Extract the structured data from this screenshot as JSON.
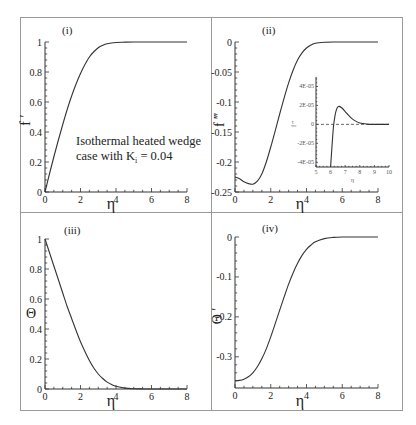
{
  "figure": {
    "annotation": {
      "line1": "Isothermal heated wedge",
      "line2_prefix": "case with K",
      "line2_sub": "i",
      "line2_suffix": " = 0.04"
    }
  },
  "chart_data": [
    {
      "panel": "(i)",
      "type": "line",
      "xlabel": "η",
      "ylabel": "f ′",
      "xlim": [
        0,
        8
      ],
      "ylim": [
        0,
        1
      ],
      "xticks": [
        0,
        2,
        4,
        6,
        8
      ],
      "yticks": [
        0,
        0.2,
        0.4,
        0.6,
        0.8,
        1
      ],
      "ytick_labels": [
        "0",
        "0.2",
        "0.4",
        "0.6",
        "0.8",
        "1"
      ],
      "grid": false,
      "series": [
        {
          "name": "f'",
          "x": [
            0,
            0.25,
            0.5,
            0.75,
            1,
            1.25,
            1.5,
            1.75,
            2,
            2.25,
            2.5,
            2.75,
            3,
            3.25,
            3.5,
            4,
            4.5,
            5,
            6,
            7,
            8
          ],
          "y": [
            0,
            0.12,
            0.235,
            0.345,
            0.45,
            0.55,
            0.64,
            0.72,
            0.79,
            0.85,
            0.9,
            0.935,
            0.962,
            0.978,
            0.988,
            0.997,
            0.999,
            1,
            1,
            1,
            1
          ]
        }
      ]
    },
    {
      "panel": "(ii)",
      "type": "line",
      "xlabel": "η",
      "ylabel": "f ‴",
      "xlim": [
        0,
        8
      ],
      "ylim": [
        -0.25,
        0
      ],
      "xticks": [
        0,
        2,
        4,
        6,
        8
      ],
      "yticks": [
        -0.25,
        -0.2,
        -0.15,
        -0.1,
        -0.05,
        0
      ],
      "ytick_labels": [
        "-0.25",
        "-0.2",
        "-0.15",
        "-0.1",
        "-0.05",
        "0"
      ],
      "grid": false,
      "series": [
        {
          "name": "f'''",
          "x": [
            0,
            0.25,
            0.5,
            0.75,
            1,
            1.25,
            1.5,
            1.75,
            2,
            2.25,
            2.5,
            2.75,
            3,
            3.25,
            3.5,
            3.75,
            4,
            4.25,
            4.5,
            5,
            5.5,
            6,
            7,
            8
          ],
          "y": [
            -0.225,
            -0.228,
            -0.233,
            -0.236,
            -0.237,
            -0.232,
            -0.22,
            -0.2,
            -0.175,
            -0.148,
            -0.12,
            -0.093,
            -0.068,
            -0.047,
            -0.03,
            -0.018,
            -0.01,
            -0.005,
            -0.002,
            -0.0005,
            0,
            0,
            0,
            0
          ]
        }
      ],
      "inset": {
        "type": "line",
        "xlabel": "η",
        "ylabel": "f ‴",
        "xlim": [
          5,
          10
        ],
        "ylim": [
          -4.5e-05,
          5e-05
        ],
        "xticks": [
          5,
          6,
          7,
          8,
          9,
          10
        ],
        "yticks": [
          -4e-05,
          -2e-05,
          0,
          2e-05,
          4e-05
        ],
        "ytick_labels": [
          "-4E-05",
          "-2E-05",
          "0",
          "2E-05",
          "4E-05"
        ],
        "reference_line": {
          "y": 0,
          "style": "dashed"
        },
        "series": [
          {
            "name": "f''' (zoom)",
            "x": [
              6.0,
              6.1,
              6.2,
              6.3,
              6.4,
              6.5,
              6.6,
              6.8,
              7.0,
              7.3,
              7.6,
              8.0,
              8.5,
              9.0,
              9.5,
              10.0
            ],
            "y": [
              -4.5e-05,
              -2.2e-05,
              -2e-06,
              9e-06,
              1.55e-05,
              1.85e-05,
              1.9e-05,
              1.7e-05,
              1.35e-05,
              8.5e-06,
              4.5e-06,
              1.5e-06,
              3e-07,
              0,
              0,
              0
            ]
          }
        ]
      }
    },
    {
      "panel": "(iii)",
      "type": "line",
      "xlabel": "η",
      "ylabel": "Θ",
      "xlim": [
        0,
        8
      ],
      "ylim": [
        0,
        1
      ],
      "xticks": [
        0,
        2,
        4,
        6,
        8
      ],
      "yticks": [
        0,
        0.2,
        0.4,
        0.6,
        0.8,
        1
      ],
      "ytick_labels": [
        "0",
        "0.2",
        "0.4",
        "0.6",
        "0.8",
        "1"
      ],
      "grid": false,
      "series": [
        {
          "name": "Θ",
          "x": [
            0,
            0.25,
            0.5,
            0.75,
            1,
            1.25,
            1.5,
            1.75,
            2,
            2.25,
            2.5,
            2.75,
            3,
            3.25,
            3.5,
            3.75,
            4,
            4.5,
            5,
            5.5,
            6,
            7,
            8
          ],
          "y": [
            1,
            0.91,
            0.82,
            0.73,
            0.64,
            0.55,
            0.47,
            0.39,
            0.315,
            0.25,
            0.19,
            0.14,
            0.1,
            0.07,
            0.046,
            0.03,
            0.018,
            0.006,
            0.0015,
            0.0004,
            0,
            0,
            0
          ]
        }
      ]
    },
    {
      "panel": "(iv)",
      "type": "line",
      "xlabel": "η",
      "ylabel": "Θ ′",
      "xlim": [
        0,
        8
      ],
      "ylim": [
        -0.378,
        0
      ],
      "xticks": [
        0,
        2,
        4,
        6,
        8
      ],
      "yticks": [
        -0.3,
        -0.2,
        -0.1,
        0
      ],
      "ytick_labels": [
        "-0.3",
        "-0.2",
        "-0.1",
        "0"
      ],
      "grid": false,
      "series": [
        {
          "name": "Θ'",
          "x": [
            0,
            0.25,
            0.5,
            0.75,
            1,
            1.25,
            1.5,
            1.75,
            2,
            2.25,
            2.5,
            2.75,
            3,
            3.25,
            3.5,
            3.75,
            4,
            4.25,
            4.5,
            5,
            5.5,
            6,
            7,
            8
          ],
          "y": [
            -0.36,
            -0.359,
            -0.356,
            -0.35,
            -0.34,
            -0.325,
            -0.305,
            -0.28,
            -0.25,
            -0.217,
            -0.183,
            -0.15,
            -0.118,
            -0.09,
            -0.066,
            -0.046,
            -0.031,
            -0.02,
            -0.012,
            -0.004,
            -0.001,
            0,
            0,
            0
          ]
        }
      ]
    }
  ]
}
